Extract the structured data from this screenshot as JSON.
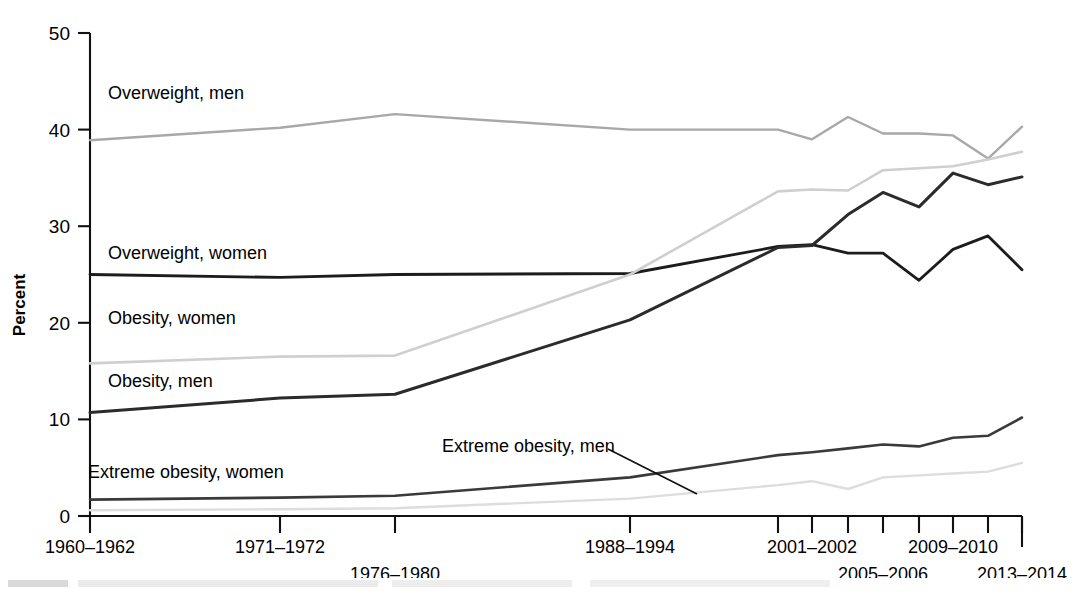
{
  "figure": {
    "y_axis_title": "Percent",
    "y_ticks": [
      0,
      10,
      20,
      30,
      40,
      50
    ],
    "x_tick_labels_row1": [
      "1960–1962",
      "1971–1972",
      "1988–1994",
      "2001–2002",
      "2009–2010"
    ],
    "x_tick_labels_row2": [
      "1976–1980",
      "2005–2006",
      "2013–2014"
    ],
    "series_labels": [
      "Overweight, men",
      "Overweight, women",
      "Obesity, women",
      "Obesity, men",
      "Extreme obesity, women",
      "Extreme obesity, men"
    ],
    "colors": {
      "overweight_men": "#a8a8a8",
      "overweight_women": "#1c1c1c",
      "obesity_women": "#cfcfcf",
      "obesity_men": "#2b2b2b",
      "extreme_obesity_women": "#3a3a3a",
      "extreme_obesity_men": "#dddddd",
      "axis": "#111111"
    }
  },
  "chart_data": {
    "type": "line",
    "title": "",
    "xlabel": "",
    "ylabel": "Percent",
    "ylim": [
      0,
      50
    ],
    "grid": false,
    "legend": "inline-labels",
    "categories": [
      "1960–1962",
      "1971–1974",
      "1976–1980",
      "1988–1994",
      "1999–2000",
      "2001–2002",
      "2003–2004",
      "2005–2006",
      "2007–2008",
      "2009–2010",
      "2011–2012",
      "2013–2014"
    ],
    "x_positions_px": [
      90,
      280,
      395,
      630,
      778,
      812,
      848,
      883,
      919,
      953,
      988,
      1022
    ],
    "series": [
      {
        "name": "Overweight, men",
        "color": "#a8a8a8",
        "values": [
          38.9,
          40.2,
          41.6,
          40.0,
          40.0,
          39.0,
          41.3,
          39.6,
          39.6,
          39.4,
          37.0,
          40.3
        ]
      },
      {
        "name": "Overweight, women",
        "color": "#1c1c1c",
        "values": [
          25.0,
          24.7,
          25.0,
          25.1,
          27.9,
          28.1,
          27.2,
          27.2,
          24.4,
          27.6,
          29.0,
          25.5
        ]
      },
      {
        "name": "Obesity, women",
        "color": "#cfcfcf",
        "values": [
          15.8,
          16.5,
          16.6,
          25.0,
          33.6,
          33.8,
          33.7,
          35.8,
          36.0,
          36.2,
          36.9,
          37.7
        ]
      },
      {
        "name": "Obesity, men",
        "color": "#2b2b2b",
        "values": [
          10.7,
          12.2,
          12.6,
          20.3,
          27.8,
          28.0,
          31.2,
          33.5,
          32.0,
          35.5,
          34.3,
          35.1
        ]
      },
      {
        "name": "Extreme obesity, women",
        "color": "#3a3a3a",
        "values": [
          1.7,
          1.9,
          2.1,
          4.0,
          6.3,
          6.6,
          7.0,
          7.4,
          7.2,
          8.1,
          8.3,
          10.2
        ]
      },
      {
        "name": "Extreme obesity, men",
        "color": "#dddddd",
        "values": [
          0.6,
          0.7,
          0.8,
          1.8,
          3.2,
          3.6,
          2.8,
          4.0,
          4.2,
          4.4,
          4.6,
          5.5
        ]
      }
    ],
    "annotations": [
      {
        "text": "Overweight, men",
        "x_px": 108,
        "y_px": 99
      },
      {
        "text": "Overweight, women",
        "x_px": 108,
        "y_px": 259
      },
      {
        "text": "Obesity, women",
        "x_px": 108,
        "y_px": 324
      },
      {
        "text": "Obesity, men",
        "x_px": 108,
        "y_px": 387
      },
      {
        "text": "Extreme obesity, women",
        "x_px": 88,
        "y_px": 478
      },
      {
        "text": "Extreme obesity, men",
        "x_px": 442,
        "y_px": 452,
        "leader": true
      }
    ]
  }
}
